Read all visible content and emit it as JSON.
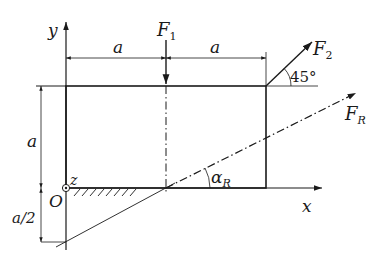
{
  "diagram": {
    "type": "statics-force-diagram",
    "axes": {
      "x_label": "x",
      "y_label": "y",
      "z_label": "z",
      "origin_label": "O"
    },
    "dimensions": {
      "top_left": "a",
      "top_right": "a",
      "left_height": "a",
      "left_below": "a/2"
    },
    "forces": {
      "f1": {
        "main": "F",
        "sub": "1"
      },
      "f2": {
        "main": "F",
        "sub": "2",
        "angle_label": "45°"
      },
      "fr": {
        "main": "F",
        "sub": "R",
        "angle_main": "α",
        "angle_sub": "R"
      }
    },
    "colors": {
      "stroke": "#1a1a1a",
      "background": "#ffffff"
    }
  }
}
